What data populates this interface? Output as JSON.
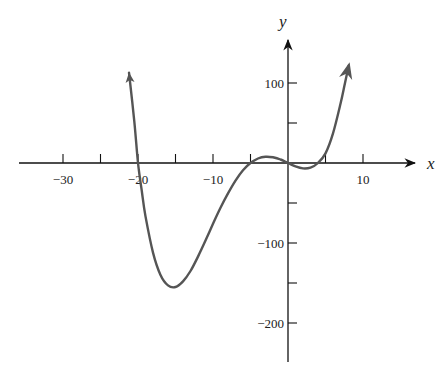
{
  "chart_data": {
    "type": "line",
    "title": "",
    "xlabel": "x",
    "ylabel": "y",
    "xlim": [
      -36,
      14
    ],
    "ylim": [
      -252,
      150
    ],
    "x_ticks": [
      -30,
      -25,
      -20,
      -15,
      -10,
      -5,
      5,
      10
    ],
    "x_tick_labels": [
      {
        "value": -30,
        "label": "−30"
      },
      {
        "value": -20,
        "label": "−20"
      },
      {
        "value": -10,
        "label": "−10"
      },
      {
        "value": 10,
        "label": "10"
      }
    ],
    "y_ticks": [
      100,
      50,
      -50,
      -100,
      -150,
      -200
    ],
    "y_tick_labels": [
      {
        "value": 100,
        "label": "100"
      },
      {
        "value": -100,
        "label": "−100"
      },
      {
        "value": -200,
        "label": "−200"
      }
    ],
    "grid": false,
    "series": [
      {
        "name": "f(x)",
        "color": "#555555",
        "end_arrows": true,
        "points": [
          [
            -21.2,
            113
          ],
          [
            -20.5,
            52
          ],
          [
            -20,
            0
          ],
          [
            -19.5,
            -35
          ],
          [
            -19,
            -66.7
          ],
          [
            -18,
            -112
          ],
          [
            -17,
            -140
          ],
          [
            -16,
            -153
          ],
          [
            -15,
            -155
          ],
          [
            -14,
            -148
          ],
          [
            -13,
            -135
          ],
          [
            -12,
            -117
          ],
          [
            -11,
            -97
          ],
          [
            -10,
            -76
          ],
          [
            -9,
            -56
          ],
          [
            -8,
            -38
          ],
          [
            -7,
            -22
          ],
          [
            -6,
            -9
          ],
          [
            -5,
            0
          ],
          [
            -4,
            5.6
          ],
          [
            -3,
            7.8
          ],
          [
            -2,
            7.1
          ],
          [
            -1,
            4.4
          ],
          [
            0,
            0
          ],
          [
            1,
            -4.2
          ],
          [
            2,
            -6.7
          ],
          [
            3,
            -5.7
          ],
          [
            4,
            0
          ],
          [
            5,
            12
          ],
          [
            6,
            37
          ],
          [
            7,
            74
          ],
          [
            7.6,
            100
          ],
          [
            8.1,
            122
          ]
        ]
      }
    ],
    "annotations": []
  }
}
